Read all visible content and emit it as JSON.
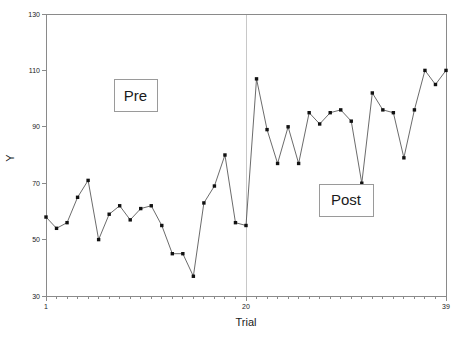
{
  "chart_data": {
    "type": "line",
    "title": "",
    "subtitle": "",
    "xlabel": "Trial",
    "ylabel": "Y",
    "xlim": [
      1,
      39
    ],
    "ylim": [
      30,
      130
    ],
    "grid": false,
    "legend": null,
    "x_ticks_labeled": [
      "1",
      "20",
      "39"
    ],
    "x_tick_values": [
      1,
      20,
      39
    ],
    "y_ticks_labeled": [
      "30",
      "50",
      "70",
      "90",
      "110",
      "130"
    ],
    "y_tick_values": [
      30,
      50,
      70,
      90,
      110,
      130
    ],
    "x_minor_ticks_every": 1,
    "marker": "square",
    "marker_color": "#111111",
    "line_color": "#5a5a5a",
    "reference_lines": [
      {
        "x": 1,
        "color": "#c8c8c8"
      },
      {
        "x": 20,
        "color": "#c8c8c8"
      },
      {
        "x": 39,
        "color": "#c8c8c8"
      }
    ],
    "annotations": [
      {
        "label": "Pre",
        "x": 9.5,
        "y": 101
      },
      {
        "label": "Post",
        "x": 29.5,
        "y": 64
      }
    ],
    "x": [
      1,
      2,
      3,
      4,
      5,
      6,
      7,
      8,
      9,
      10,
      11,
      12,
      13,
      14,
      15,
      16,
      17,
      18,
      19,
      20,
      21,
      22,
      23,
      24,
      25,
      26,
      27,
      28,
      29,
      30,
      31,
      32,
      33,
      34,
      35,
      36,
      37,
      38,
      39
    ],
    "values": [
      58,
      54,
      56,
      65,
      71,
      50,
      59,
      62,
      57,
      61,
      62,
      55,
      45,
      45,
      37,
      63,
      69,
      80,
      56,
      55,
      107,
      89,
      77,
      90,
      77,
      95,
      91,
      95,
      96,
      92,
      70,
      102,
      96,
      95,
      79,
      96,
      110,
      105,
      110
    ],
    "series": [
      {
        "name": "Y",
        "values": [
          58,
          54,
          56,
          65,
          71,
          50,
          59,
          62,
          57,
          61,
          62,
          55,
          45,
          45,
          37,
          63,
          69,
          80,
          56,
          55,
          107,
          89,
          77,
          90,
          77,
          95,
          91,
          95,
          96,
          92,
          70,
          102,
          96,
          95,
          79,
          96,
          110,
          105,
          110
        ]
      }
    ]
  },
  "labels": {
    "x_axis_title": "Trial",
    "y_axis_title": "Y",
    "pre_box": "Pre",
    "post_box": "Post"
  }
}
